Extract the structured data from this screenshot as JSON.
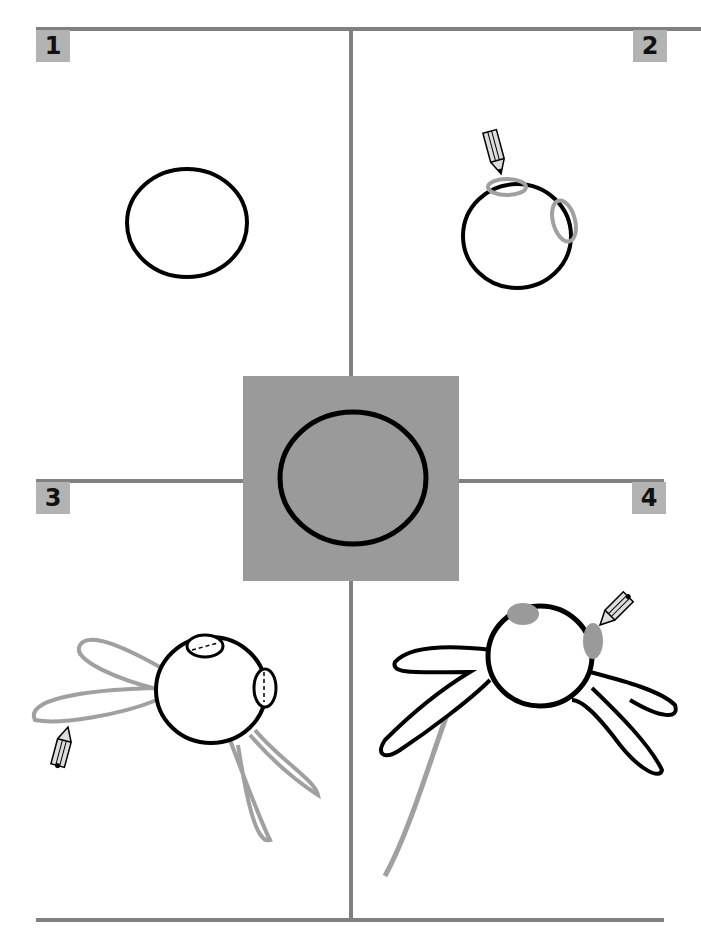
{
  "colors": {
    "frame": "#808080",
    "badge": "#b3b3b3",
    "ink": "#000000",
    "guide": "#a0a0a0",
    "center_box": "#9a9a9a"
  },
  "steps": [
    {
      "number": "1",
      "description": "Draw a circle"
    },
    {
      "number": "2",
      "description": "Add two small ovals on the circle edge"
    },
    {
      "number": "3",
      "description": "Sketch long petal shapes around the circle"
    },
    {
      "number": "4",
      "description": "Ink the petals and add a curved stem"
    }
  ],
  "icons": [
    "pencil-icon"
  ]
}
